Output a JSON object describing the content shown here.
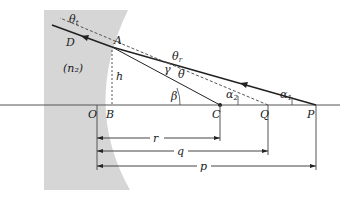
{
  "diagram": {
    "type": "optics-refraction-spherical-surface",
    "medium_label": "(n₂)",
    "points": {
      "A": "A",
      "O": "O",
      "B": "B",
      "C": "C",
      "Q": "Q",
      "P": "P",
      "D": "D"
    },
    "angles": {
      "theta_t": "θ",
      "theta_t_sub": "t",
      "theta_r": "θ",
      "theta_r_sub": "r",
      "theta": "θ",
      "gamma": "γ",
      "beta": "β",
      "alpha1": "α",
      "alpha1_sub": "1",
      "alpha2": "α",
      "alpha2_sub": "2"
    },
    "lengths": {
      "h": "h",
      "r": "r",
      "q": "q",
      "p": "p"
    },
    "colors": {
      "medium": "#d6d6d6",
      "line": "#222222",
      "axis": "#555555"
    }
  }
}
